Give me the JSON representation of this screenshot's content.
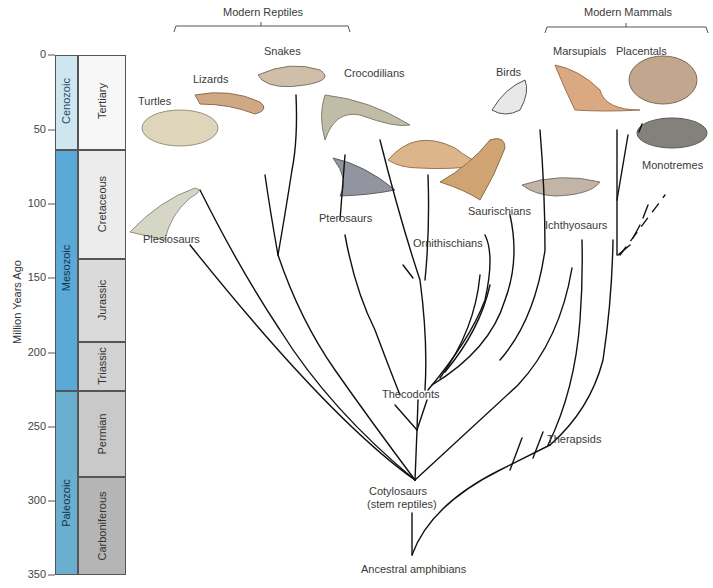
{
  "axis": {
    "label": "Million Years Ago",
    "ticks": [
      "0",
      "50",
      "100",
      "150",
      "200",
      "250",
      "300",
      "350"
    ]
  },
  "eras": [
    {
      "name": "Cenozoic",
      "color": "#cfe6f1"
    },
    {
      "name": "Mesozoic",
      "color": "#5ba9d6"
    },
    {
      "name": "Paleozoic",
      "color": "#6aaed0"
    }
  ],
  "periods": [
    {
      "name": "Tertiary",
      "color": "#f7f7f7"
    },
    {
      "name": "Cretaceous",
      "color": "#ececec"
    },
    {
      "name": "Jurassic",
      "color": "#dadada"
    },
    {
      "name": "Triassic",
      "color": "#d2d2d2"
    },
    {
      "name": "Permian",
      "color": "#c9c9c9"
    },
    {
      "name": "Carboniferous",
      "color": "#b5b5b5"
    }
  ],
  "groups": {
    "modern_reptiles": "Modern Reptiles",
    "modern_mammals": "Modern Mammals"
  },
  "taxa": {
    "turtles": "Turtles",
    "lizards": "Lizards",
    "snakes": "Snakes",
    "crocodilians": "Crocodilians",
    "birds": "Birds",
    "marsupials": "Marsupials",
    "placentals": "Placentals",
    "monotremes": "Monotremes",
    "plesiosaurs": "Plesiosaurs",
    "pterosaurs": "Pterosaurs",
    "ornithischians": "Ornithischians",
    "saurischians": "Saurischians",
    "ichthyosaurs": "Ichthyosaurs",
    "thecodonts": "Thecodonts",
    "therapsids": "Therapsids",
    "cotylosaurs_line1": "Cotylosaurs",
    "cotylosaurs_line2": "(stem reptiles)",
    "ancestral": "Ancestral amphibians"
  }
}
